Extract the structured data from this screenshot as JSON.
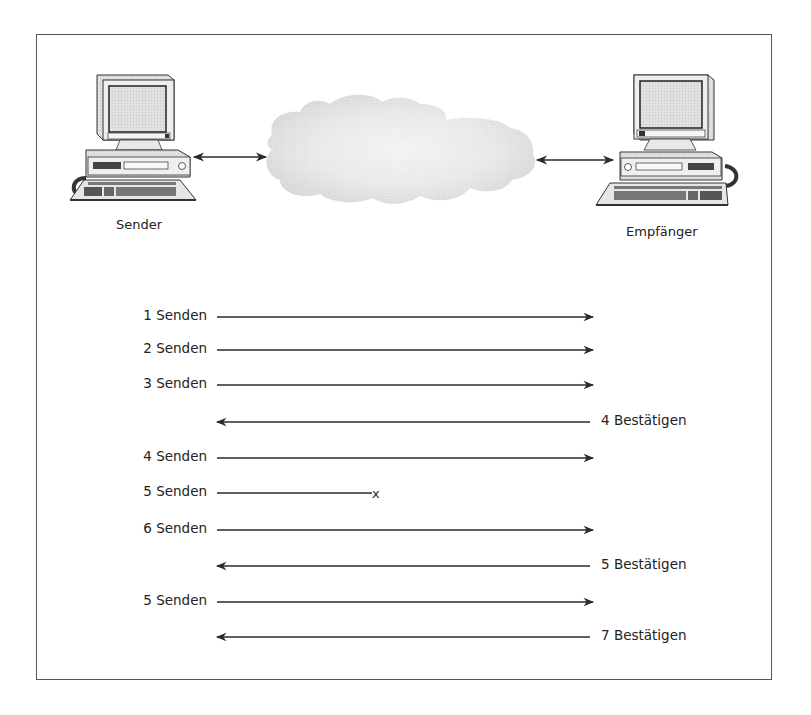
{
  "diagram": {
    "nodes": {
      "sender": {
        "label": "Sender",
        "icon": "desktop-computer-icon"
      },
      "network": {
        "icon": "cloud-icon"
      },
      "receiver": {
        "label": "Empfänger",
        "icon": "desktop-computer-icon"
      }
    },
    "links": [
      {
        "from": "sender",
        "to": "network",
        "type": "bidirectional"
      },
      {
        "from": "network",
        "to": "receiver",
        "type": "bidirectional"
      }
    ],
    "sequence": [
      {
        "direction": "right",
        "label": "1 Senden",
        "y": 317
      },
      {
        "direction": "right",
        "label": "2 Senden",
        "y": 350
      },
      {
        "direction": "right",
        "label": "3 Senden",
        "y": 385
      },
      {
        "direction": "left",
        "label": "4 Bestätigen",
        "y": 422
      },
      {
        "direction": "right",
        "label": "4 Senden",
        "y": 458
      },
      {
        "direction": "lost",
        "label": "5 Senden",
        "y": 493
      },
      {
        "direction": "right",
        "label": "6 Senden",
        "y": 530
      },
      {
        "direction": "left",
        "label": "5 Bestätigen",
        "y": 566
      },
      {
        "direction": "right",
        "label": "5 Senden",
        "y": 602
      },
      {
        "direction": "left",
        "label": "7 Bestätigen",
        "y": 637
      }
    ],
    "lost_marker": "x"
  },
  "colors": {
    "line": "#2a2a2a",
    "frame": "#555555",
    "cloud": "#e4e4e4"
  }
}
